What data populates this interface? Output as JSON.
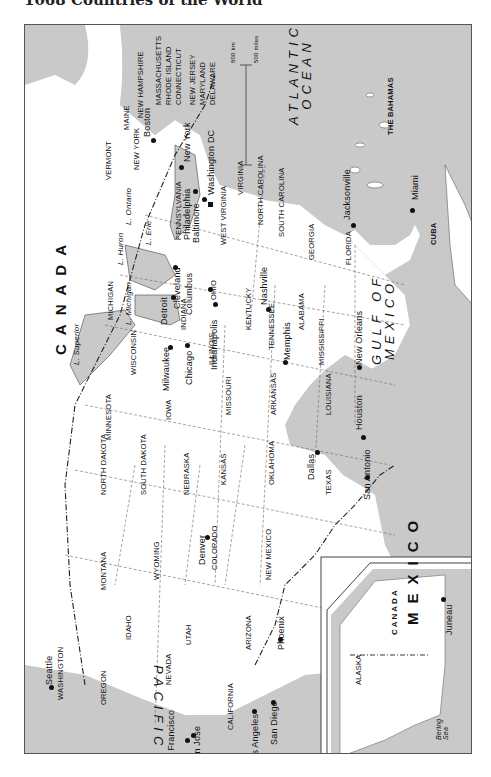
{
  "header": {
    "title": "1068   Countries of the World"
  },
  "map": {
    "colors": {
      "water": "#c9c9c9",
      "land": "#ffffff",
      "border": "#555555"
    },
    "countries": [
      {
        "name": "CANADA"
      },
      {
        "name": "MEXICO"
      },
      {
        "name": "CUBA"
      },
      {
        "name": "THE BAHAMAS"
      }
    ],
    "water_bodies": [
      {
        "name": "ATLANTIC OCEAN",
        "line1": "ATLANTIC",
        "line2": "OCEAN"
      },
      {
        "name": "GULF OF MEXICO",
        "line1": "GULF OF",
        "line2": "MEXICO"
      },
      {
        "name": "PACIFIC OCEAN"
      },
      {
        "name": "Bering Sea",
        "line1": "Bering",
        "line2": "Sea"
      }
    ],
    "lakes": [
      "L. Superior",
      "L. Michigan",
      "L. Huron",
      "L. Erie",
      "L. Ontario"
    ],
    "states": [
      "MAINE",
      "NEW HAMPSHIRE",
      "MASSACHUSETTS",
      "RHODE ISLAND",
      "CONNECTICUT",
      "NEW JERSEY",
      "MARYLAND",
      "DELAWARE",
      "VERMONT",
      "NEW YORK",
      "PENNSYLVANIA",
      "WEST VIRGINIA",
      "VIRGINIA",
      "NORTH CAROLINA",
      "SOUTH CAROLINA",
      "GEORGIA",
      "FLORIDA",
      "OHIO",
      "MICHIGAN",
      "INDIANA",
      "KENTUCKY",
      "TENNESSEE",
      "ALABAMA",
      "MISSISSIPPI",
      "ILLINOIS",
      "WISCONSIN",
      "MINNESOTA",
      "IOWA",
      "MISSOURI",
      "ARKANSAS",
      "LOUISIANA",
      "NORTH DAKOTA",
      "SOUTH DAKOTA",
      "NEBRASKA",
      "KANSAS",
      "OKLAHOMA",
      "TEXAS",
      "MONTANA",
      "WYOMING",
      "COLORADO",
      "NEW MEXICO",
      "IDAHO",
      "UTAH",
      "ARIZONA",
      "WASHINGTON",
      "OREGON",
      "NEVADA",
      "CALIFORNIA",
      "ALASKA"
    ],
    "cities": [
      "Boston",
      "New York",
      "Philadelphia",
      "Baltimore",
      "Washington DC",
      "Cleveland",
      "Columbus",
      "Detroit",
      "Indianapolis",
      "Nashville",
      "Memphis",
      "Jacksonville",
      "Miami",
      "New Orleans",
      "Chicago",
      "Milwaukee",
      "Houston",
      "San Antonio",
      "Dallas",
      "Denver",
      "Phoenix",
      "Seattle",
      "San Francisco",
      "San Jose",
      "Los Angeles",
      "San Diego",
      "Juneau"
    ],
    "scale_bar": {
      "km": "800 km",
      "miles": "500 miles",
      "zero": "0"
    },
    "inset": {
      "title": "Alaska inset",
      "country": "CANADA",
      "state": "ALASKA",
      "city": "Juneau",
      "sea": "Bering Sea"
    }
  }
}
